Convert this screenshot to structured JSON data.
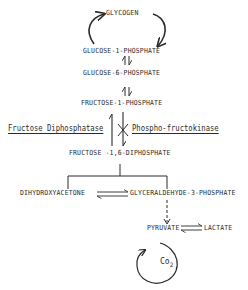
{
  "diagram": {
    "nodes": {
      "glycogen": "GLYCOGEN",
      "glucose_1_phosphate": "GLUCOSE-1-PHOSPHATE",
      "glucose_6_phosphate": "GLUCOSE-6-PHOSPHATE",
      "fructose_1_phosphate": "FRUCTOSE-1-PHOSPHATE",
      "fructose_1_6_diphosphate": "FRUCTOSE -1,6-DIPHOSPHATE",
      "dihydroxyacetone": "DIHYDROXYACETONE",
      "glyceraldehyde_3_phosphate": "GLYCERALDEHYDE-3-PHOSPHATE",
      "pyruvate": "PYRUVATE",
      "lactate": "LACTATE",
      "co2_main": "Co",
      "co2_sub": "2"
    },
    "enzymes": {
      "left": "Fructose Diphosphatase",
      "right": "Phospho-fructokinase"
    },
    "colors": {
      "ink": "#2a2a2a",
      "background": "#ffffff"
    }
  }
}
